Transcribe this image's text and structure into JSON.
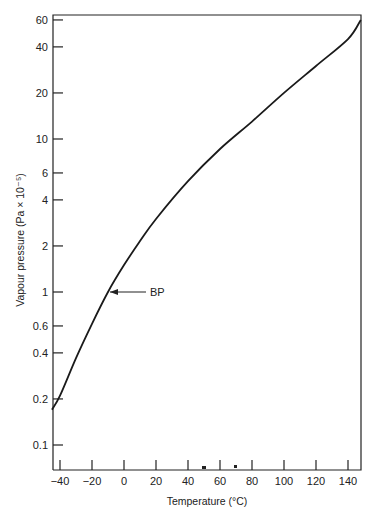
{
  "chart_data": {
    "type": "line",
    "title": "",
    "xlabel": "Temperature (°C)",
    "ylabel": "Vapour pressure (Pa × 10⁻⁵)",
    "yscale": "log",
    "xlim": [
      -45,
      148
    ],
    "ylim": [
      0.07,
      64
    ],
    "grid": false,
    "legend": null,
    "x_ticks": [
      -40,
      -20,
      0,
      20,
      40,
      60,
      80,
      100,
      120,
      140
    ],
    "x_tick_labels": [
      "−40",
      "−20",
      "0",
      "20",
      "40",
      "60",
      "80",
      "100",
      "120",
      "140"
    ],
    "y_ticks": [
      0.1,
      0.2,
      0.4,
      0.6,
      1,
      2,
      4,
      6,
      10,
      20,
      40,
      60
    ],
    "y_tick_labels": [
      "0.1",
      "0.2",
      "0.4",
      "0.6",
      "1",
      "2",
      "4",
      "6",
      "10",
      "20",
      "40",
      "60"
    ],
    "series": [
      {
        "name": "Vapour pressure curve",
        "x": [
          -45,
          -40,
          -30,
          -20,
          -10,
          0,
          10,
          20,
          40,
          60,
          80,
          100,
          120,
          140,
          148
        ],
        "y": [
          0.17,
          0.21,
          0.37,
          0.62,
          1.0,
          1.5,
          2.15,
          3.0,
          5.3,
          8.6,
          13,
          20,
          30,
          45,
          60
        ]
      }
    ],
    "annotations": [
      {
        "text": "BP",
        "x": -10,
        "y": 1.0,
        "arrow": true
      }
    ]
  }
}
